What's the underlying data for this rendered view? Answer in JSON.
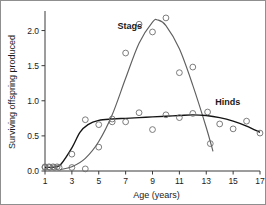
{
  "chart_data": {
    "type": "scatter",
    "title": "",
    "xlabel": "Age (years)",
    "ylabel": "Surviving offspring produced",
    "xlim": [
      1,
      17
    ],
    "ylim": [
      0.0,
      2.25
    ],
    "xticks": [
      1,
      3,
      5,
      7,
      9,
      11,
      13,
      15,
      17
    ],
    "xtick_labels": [
      "1",
      "3",
      "5",
      "7",
      "9",
      "11",
      "13",
      "15",
      "17"
    ],
    "yticks": [
      0.0,
      0.5,
      1.0,
      1.5,
      2.0
    ],
    "ytick_labels": [
      "0.0",
      "0.5",
      "1.0",
      "1.5",
      "2.0"
    ],
    "grid": false,
    "legend_position": "inline-annotations",
    "series": [
      {
        "name": "Stags",
        "label_x": 7.3,
        "label_y": 2.02,
        "marker": "open-circle",
        "color": "#5f5f5f",
        "points": [
          {
            "x": 1.0,
            "y": 0.05
          },
          {
            "x": 1.35,
            "y": 0.05
          },
          {
            "x": 1.7,
            "y": 0.05
          },
          {
            "x": 2.05,
            "y": 0.05
          },
          {
            "x": 3.0,
            "y": 0.05
          },
          {
            "x": 4.0,
            "y": 0.03
          },
          {
            "x": 5.0,
            "y": 0.34
          },
          {
            "x": 6.0,
            "y": 0.74
          },
          {
            "x": 7.0,
            "y": 1.68
          },
          {
            "x": 8.0,
            "y": 2.09
          },
          {
            "x": 9.0,
            "y": 1.98
          },
          {
            "x": 10.0,
            "y": 2.18
          },
          {
            "x": 11.0,
            "y": 1.4
          },
          {
            "x": 12.0,
            "y": 1.48
          },
          {
            "x": 13.3,
            "y": 0.39
          }
        ],
        "fit_curve": [
          {
            "x": 2.1,
            "y": 0.02
          },
          {
            "x": 3.0,
            "y": 0.06
          },
          {
            "x": 4.0,
            "y": 0.18
          },
          {
            "x": 5.0,
            "y": 0.42
          },
          {
            "x": 6.0,
            "y": 0.8
          },
          {
            "x": 7.0,
            "y": 1.32
          },
          {
            "x": 8.0,
            "y": 1.82
          },
          {
            "x": 9.0,
            "y": 2.12
          },
          {
            "x": 9.4,
            "y": 2.15
          },
          {
            "x": 10.0,
            "y": 2.07
          },
          {
            "x": 11.0,
            "y": 1.74
          },
          {
            "x": 12.0,
            "y": 1.22
          },
          {
            "x": 13.0,
            "y": 0.62
          },
          {
            "x": 13.5,
            "y": 0.28
          }
        ]
      },
      {
        "name": "Hinds",
        "label_x": 14.6,
        "label_y": 0.94,
        "marker": "open-circle",
        "color": "#141414",
        "points": [
          {
            "x": 1.0,
            "y": 0.06
          },
          {
            "x": 1.3,
            "y": 0.06
          },
          {
            "x": 1.6,
            "y": 0.06
          },
          {
            "x": 1.9,
            "y": 0.06
          },
          {
            "x": 3.0,
            "y": 0.24
          },
          {
            "x": 4.0,
            "y": 0.73
          },
          {
            "x": 5.0,
            "y": 0.66
          },
          {
            "x": 6.0,
            "y": 0.7
          },
          {
            "x": 7.0,
            "y": 0.7
          },
          {
            "x": 8.0,
            "y": 0.83
          },
          {
            "x": 9.0,
            "y": 0.59
          },
          {
            "x": 10.0,
            "y": 0.8
          },
          {
            "x": 11.0,
            "y": 0.76
          },
          {
            "x": 12.0,
            "y": 0.82
          },
          {
            "x": 13.1,
            "y": 0.84
          },
          {
            "x": 14.0,
            "y": 0.67
          },
          {
            "x": 15.0,
            "y": 0.6
          },
          {
            "x": 16.0,
            "y": 0.71
          },
          {
            "x": 17.0,
            "y": 0.54
          }
        ],
        "fit_curve": [
          {
            "x": 1.0,
            "y": 0.05
          },
          {
            "x": 1.8,
            "y": 0.06
          },
          {
            "x": 2.2,
            "y": 0.1
          },
          {
            "x": 3.0,
            "y": 0.33
          },
          {
            "x": 3.6,
            "y": 0.55
          },
          {
            "x": 4.2,
            "y": 0.66
          },
          {
            "x": 5.0,
            "y": 0.72
          },
          {
            "x": 6.0,
            "y": 0.74
          },
          {
            "x": 7.0,
            "y": 0.75
          },
          {
            "x": 8.0,
            "y": 0.76
          },
          {
            "x": 9.0,
            "y": 0.77
          },
          {
            "x": 10.0,
            "y": 0.78
          },
          {
            "x": 11.0,
            "y": 0.79
          },
          {
            "x": 12.0,
            "y": 0.8
          },
          {
            "x": 13.0,
            "y": 0.79
          },
          {
            "x": 14.0,
            "y": 0.76
          },
          {
            "x": 15.0,
            "y": 0.71
          },
          {
            "x": 16.0,
            "y": 0.64
          },
          {
            "x": 17.0,
            "y": 0.55
          }
        ]
      }
    ]
  }
}
